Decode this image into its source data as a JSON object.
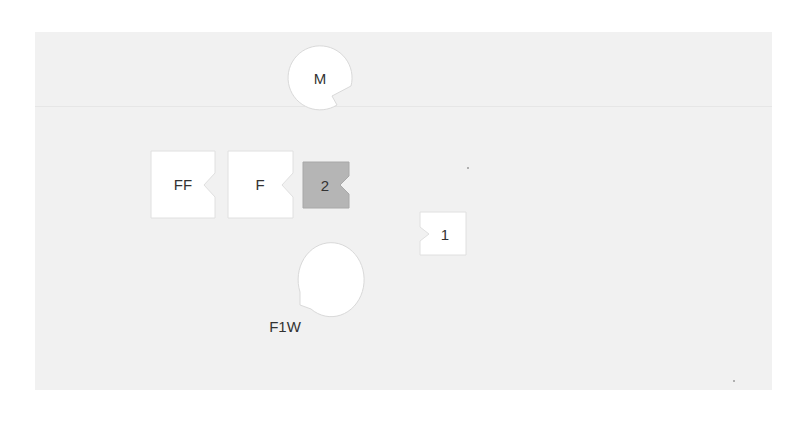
{
  "diagram": {
    "background": "#ffffff",
    "panel_color": "#f1f1f1",
    "nodes": [
      {
        "id": "M",
        "label": "M",
        "shape": "circle",
        "fill": "#ffffff",
        "notch": "bottom-right"
      },
      {
        "id": "FF",
        "label": "FF",
        "shape": "square",
        "fill": "#ffffff",
        "notch": "right"
      },
      {
        "id": "F",
        "label": "F",
        "shape": "square",
        "fill": "#ffffff",
        "notch": "right"
      },
      {
        "id": "2",
        "label": "2",
        "shape": "square",
        "fill": "#b5b5b5",
        "notch": "right"
      },
      {
        "id": "1",
        "label": "1",
        "shape": "square",
        "fill": "#ffffff",
        "notch": "left"
      },
      {
        "id": "F1W",
        "label": "F1W",
        "shape": "ellipse",
        "fill": "#ffffff",
        "notch": "top-right"
      }
    ]
  }
}
